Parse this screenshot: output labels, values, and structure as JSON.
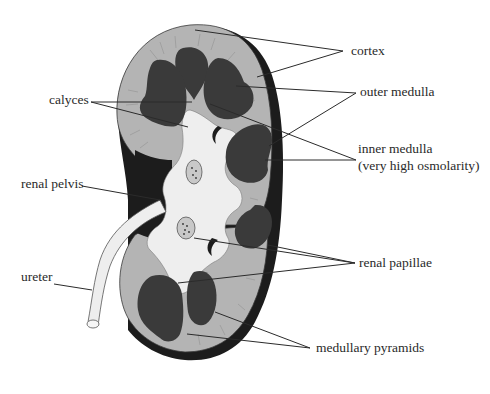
{
  "diagram": {
    "colors": {
      "background": "#ffffff",
      "capsule": "#1c1c1c",
      "cortex": "#b4b4b4",
      "pyramid": "#3a3a3a",
      "pelvis": "#eeeeee",
      "vessel": "#c8c8c8",
      "leader_line": "#2b2b2b",
      "label_text": "#2a2a2a"
    },
    "labels": {
      "cortex": "cortex",
      "outer_medulla": "outer medulla",
      "inner_medulla_line1": "inner medulla",
      "inner_medulla_line2": "(very high osmolarity)",
      "calyces": "calyces",
      "renal_pelvis": "renal pelvis",
      "renal_papillae": "renal papillae",
      "ureter": "ureter",
      "medullary_pyramids": "medullary pyramids"
    }
  }
}
